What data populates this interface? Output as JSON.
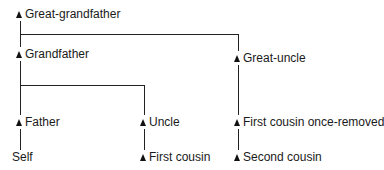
{
  "diagram": {
    "type": "family-tree",
    "nodes": {
      "great_grandfather": "Great-grandfather",
      "grandfather": "Grandfather",
      "great_uncle": "Great-uncle",
      "father": "Father",
      "uncle": "Uncle",
      "first_cousin_once_removed": "First cousin once-removed",
      "self": "Self",
      "first_cousin": "First cousin",
      "second_cousin": "Second cousin"
    },
    "edges": [
      [
        "Great-grandfather",
        "Grandfather"
      ],
      [
        "Great-grandfather",
        "Great-uncle"
      ],
      [
        "Grandfather",
        "Father"
      ],
      [
        "Grandfather",
        "Uncle"
      ],
      [
        "Father",
        "Self"
      ],
      [
        "Uncle",
        "First cousin"
      ],
      [
        "Great-uncle",
        "First cousin once-removed"
      ],
      [
        "First cousin once-removed",
        "Second cousin"
      ]
    ]
  }
}
